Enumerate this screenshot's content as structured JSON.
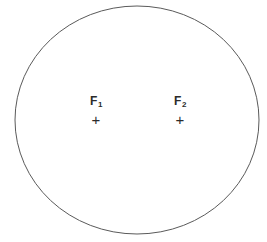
{
  "figure": {
    "type": "ellipse-with-foci-diagram",
    "background_color": "#ffffff",
    "stroke_color": "#5a5a5a",
    "text_color": "#2b2b2b",
    "ellipse": {
      "center_x": 137,
      "center_y": 120,
      "radius_x": 122,
      "radius_y": 114,
      "stroke_width": 1
    },
    "foci": [
      {
        "id": "focus-1",
        "label_letter": "F",
        "label_subscript": "1",
        "label_full": "F1",
        "mark_glyph": "+",
        "mark_name": "plus-mark",
        "x": 96,
        "y": 122
      },
      {
        "id": "focus-2",
        "label_letter": "F",
        "label_subscript": "2",
        "label_full": "F2",
        "mark_glyph": "+",
        "mark_name": "plus-mark",
        "x": 180,
        "y": 122
      }
    ]
  }
}
